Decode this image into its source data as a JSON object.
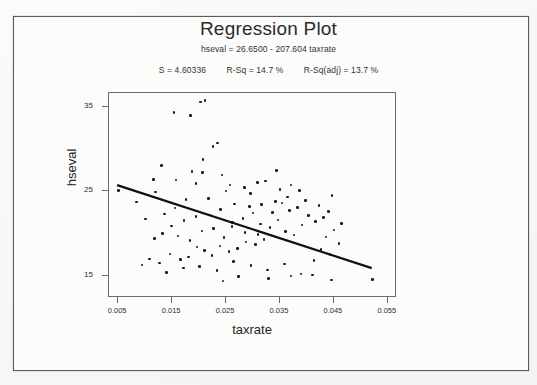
{
  "title": "Regression Plot",
  "equation": "hseval = 26.6500 - 207.604 taxrate",
  "stats": {
    "s_label": "S = 4.60336",
    "rsq_label": "R-Sq = 14.7 %",
    "rsq_adj_label": "R-Sq(adj) = 13.7 %"
  },
  "chart_data": {
    "type": "scatter",
    "title": "Regression Plot",
    "subtitle": "hseval = 26.6500 - 207.604 taxrate",
    "annotations": [
      "S = 4.60336",
      "R-Sq = 14.7 %",
      "R-Sq(adj) = 13.7 %"
    ],
    "xlabel": "taxrate",
    "ylabel": "hseval",
    "xlim": [
      0.0033,
      0.0567
    ],
    "ylim": [
      12.4,
      36.6
    ],
    "xticks": [
      0.005,
      0.015,
      0.025,
      0.035,
      0.045,
      0.055
    ],
    "xtick_labels": [
      "0.005",
      "0.015",
      "0.025",
      "0.035",
      "0.045",
      "0.055"
    ],
    "yticks": [
      15,
      25,
      35
    ],
    "ytick_labels": [
      "15",
      "25",
      "35"
    ],
    "grid": false,
    "legend": false,
    "fit_line": {
      "intercept": 26.65,
      "slope": -207.604,
      "x_start": 0.005,
      "x_end": 0.0522,
      "y_start": 25.61,
      "y_end": 15.81,
      "color": "#111111"
    },
    "marker_color": "#1a1a1a",
    "points": [
      [
        0.0052,
        25.0
      ],
      [
        0.0205,
        35.4
      ],
      [
        0.0213,
        35.6
      ],
      [
        0.0155,
        34.2
      ],
      [
        0.0186,
        33.8
      ],
      [
        0.0228,
        30.2
      ],
      [
        0.0236,
        30.6
      ],
      [
        0.0209,
        28.6
      ],
      [
        0.0132,
        27.9
      ],
      [
        0.0189,
        27.2
      ],
      [
        0.0208,
        27.1
      ],
      [
        0.0117,
        26.3
      ],
      [
        0.0159,
        26.2
      ],
      [
        0.0196,
        25.8
      ],
      [
        0.0259,
        25.6
      ],
      [
        0.0252,
        24.9
      ],
      [
        0.0297,
        24.6
      ],
      [
        0.0286,
        25.3
      ],
      [
        0.031,
        25.9
      ],
      [
        0.0325,
        26.1
      ],
      [
        0.0345,
        27.3
      ],
      [
        0.0352,
        25.1
      ],
      [
        0.0366,
        24.2
      ],
      [
        0.0372,
        25.6
      ],
      [
        0.0388,
        25.0
      ],
      [
        0.0344,
        23.7
      ],
      [
        0.0318,
        23.3
      ],
      [
        0.0295,
        23.1
      ],
      [
        0.0268,
        23.4
      ],
      [
        0.0242,
        22.7
      ],
      [
        0.0221,
        22.1
      ],
      [
        0.0196,
        21.9
      ],
      [
        0.0174,
        21.4
      ],
      [
        0.0151,
        20.8
      ],
      [
        0.0134,
        19.9
      ],
      [
        0.0119,
        19.3
      ],
      [
        0.0163,
        19.6
      ],
      [
        0.0185,
        19.1
      ],
      [
        0.0207,
        20.2
      ],
      [
        0.0229,
        20.5
      ],
      [
        0.0248,
        19.4
      ],
      [
        0.0264,
        21.2
      ],
      [
        0.0283,
        21.7
      ],
      [
        0.0302,
        22.3
      ],
      [
        0.0316,
        21.0
      ],
      [
        0.0333,
        20.6
      ],
      [
        0.0348,
        21.5
      ],
      [
        0.0362,
        20.1
      ],
      [
        0.0378,
        19.7
      ],
      [
        0.0393,
        20.9
      ],
      [
        0.0405,
        22.0
      ],
      [
        0.0418,
        21.3
      ],
      [
        0.0399,
        23.8
      ],
      [
        0.0384,
        23.0
      ],
      [
        0.037,
        22.6
      ],
      [
        0.0356,
        23.5
      ],
      [
        0.0338,
        22.4
      ],
      [
        0.0322,
        19.2
      ],
      [
        0.0306,
        18.6
      ],
      [
        0.0289,
        18.9
      ],
      [
        0.0273,
        18.1
      ],
      [
        0.0257,
        17.8
      ],
      [
        0.0241,
        18.4
      ],
      [
        0.0226,
        17.3
      ],
      [
        0.0212,
        17.9
      ],
      [
        0.0198,
        18.3
      ],
      [
        0.0182,
        17.1
      ],
      [
        0.0167,
        16.8
      ],
      [
        0.0148,
        17.5
      ],
      [
        0.0129,
        16.4
      ],
      [
        0.011,
        16.9
      ],
      [
        0.0096,
        16.2
      ],
      [
        0.0142,
        15.3
      ],
      [
        0.0173,
        15.8
      ],
      [
        0.0203,
        16.0
      ],
      [
        0.0235,
        15.5
      ],
      [
        0.0266,
        16.6
      ],
      [
        0.0298,
        16.1
      ],
      [
        0.0329,
        15.6
      ],
      [
        0.036,
        16.3
      ],
      [
        0.0391,
        15.1
      ],
      [
        0.0415,
        16.7
      ],
      [
        0.0428,
        18.0
      ],
      [
        0.0437,
        19.5
      ],
      [
        0.0445,
        17.4
      ],
      [
        0.0452,
        20.3
      ],
      [
        0.0461,
        18.7
      ],
      [
        0.0433,
        21.8
      ],
      [
        0.0424,
        23.2
      ],
      [
        0.0442,
        22.5
      ],
      [
        0.0448,
        24.4
      ],
      [
        0.0466,
        21.1
      ],
      [
        0.0331,
        14.6
      ],
      [
        0.0372,
        14.9
      ],
      [
        0.0412,
        15.0
      ],
      [
        0.0447,
        14.4
      ],
      [
        0.0523,
        14.5
      ],
      [
        0.0275,
        14.8
      ],
      [
        0.0246,
        14.3
      ],
      [
        0.0311,
        19.8
      ],
      [
        0.0287,
        20.0
      ],
      [
        0.0263,
        20.7
      ],
      [
        0.0219,
        24.0
      ],
      [
        0.0244,
        26.8
      ],
      [
        0.0178,
        23.9
      ],
      [
        0.0157,
        22.9
      ],
      [
        0.0138,
        22.2
      ],
      [
        0.0102,
        21.6
      ],
      [
        0.0086,
        23.6
      ],
      [
        0.0121,
        24.8
      ]
    ]
  },
  "icons": {
    "none": "none"
  }
}
